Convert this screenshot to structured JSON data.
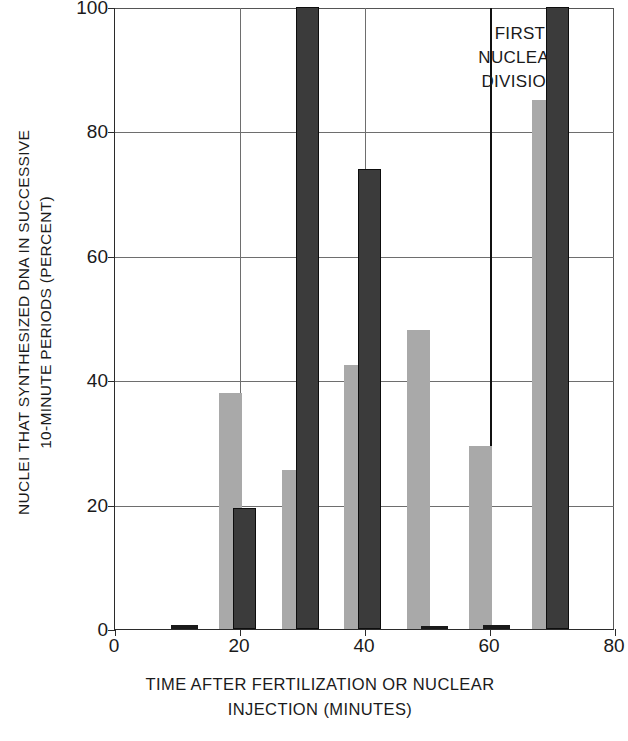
{
  "chart_data": {
    "type": "bar",
    "title": "",
    "xlabel": "TIME AFTER FERTILIZATION OR NUCLEAR INJECTION (MINUTES)",
    "xlabel_lines": [
      "TIME AFTER FERTILIZATION OR NUCLEAR",
      "INJECTION (MINUTES)"
    ],
    "ylabel": "NUCLEI THAT SYNTHESIZED DNA IN SUCCESSIVE 10-MINUTE PERIODS (PERCENT)",
    "ylabel_lines": [
      "NUCLEI THAT SYNTHESIZED DNA IN SUCCESSIVE",
      "10-MINUTE PERIODS (PERCENT)"
    ],
    "xlim": [
      0,
      80
    ],
    "ylim": [
      0,
      100
    ],
    "xticks": [
      0,
      20,
      40,
      60,
      80
    ],
    "yticks": [
      0,
      20,
      40,
      60,
      80,
      100
    ],
    "xtick_labels": [
      "0",
      "20",
      "40",
      "60",
      "80"
    ],
    "ytick_labels": [
      "0",
      "20",
      "40",
      "60",
      "80",
      "100"
    ],
    "grid": "both",
    "legend": "none",
    "x": [
      10,
      20,
      30,
      40,
      50,
      60,
      70
    ],
    "series": [
      {
        "name": "light-series",
        "color": "#a9a9a9",
        "values": [
          0,
          38,
          25.5,
          42.5,
          48,
          29.5,
          85
        ]
      },
      {
        "name": "dark-series",
        "color": "#3b3b3b",
        "values": [
          0.7,
          19.5,
          100,
          74,
          0.5,
          0.7,
          100
        ]
      }
    ],
    "annotations": [
      {
        "text": "FIRST NUCLEAR DIVISION",
        "lines": [
          "FIRST",
          "NUCLEAR",
          "DIVISION"
        ],
        "x": 47,
        "y": 96
      }
    ],
    "vertical_markers": [
      60
    ]
  },
  "axis": {
    "y_ticks": [
      {
        "label": "100",
        "value": 100
      },
      {
        "label": "80",
        "value": 80
      },
      {
        "label": "60",
        "value": 60
      },
      {
        "label": "40",
        "value": 40
      },
      {
        "label": "20",
        "value": 20
      },
      {
        "label": "0",
        "value": 0
      }
    ],
    "x_ticks": [
      {
        "label": "0",
        "value": 0
      },
      {
        "label": "20",
        "value": 20
      },
      {
        "label": "40",
        "value": 40
      },
      {
        "label": "60",
        "value": 60
      },
      {
        "label": "80",
        "value": 80
      }
    ]
  },
  "colors": {
    "light_bar": "#a9a9a9",
    "dark_bar": "#3b3b3b",
    "dark_bar_outline": "#0d0d0d",
    "axis": "#2b2b2b",
    "grid": "#6e6e6e",
    "background": "#ffffff",
    "text": "#1a1a1a"
  }
}
